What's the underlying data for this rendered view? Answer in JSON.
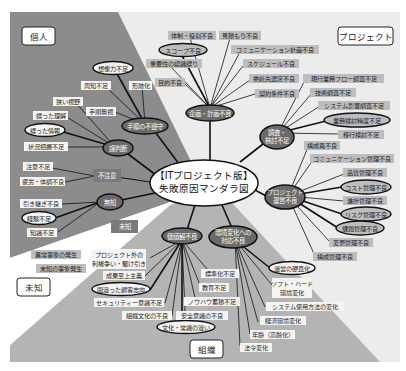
{
  "diagram": {
    "title_line1": "【ITプロジェクト版】",
    "title_line2": "失敗原因マンダラ図",
    "colors": {
      "dark_region": "#8c8c8c",
      "mid_region": "#b4b4b4",
      "light_region": "#ececec",
      "node_fill": "#6a6a6a",
      "label_bg": "#bdbdbd",
      "label_bg_white": "#f4f4f4"
    },
    "quadrants": {
      "individual": "個人",
      "project": "プロジェクト",
      "unknown": "未知",
      "organization": "組織"
    },
    "hubs": {
      "planning": "企画・計画不良",
      "procedure": "手順の不遵守",
      "misjudgment": "誤判断",
      "carelessness": "不注意",
      "ignorance": "無知",
      "unknown_hub": "未知",
      "investigation_l1": "調査・",
      "investigation_l2": "検討不足",
      "pm_l1": "プロジェクト",
      "pm_l2": "運営不良",
      "value": "価値観不良",
      "env_l1": "環境変化への",
      "env_l2": "対応不良"
    },
    "planning_items": [
      "体制・役割不良",
      "見積もり不良",
      "スコープ不良",
      "コミュニケーション計画不良",
      "重要性の認識誤り",
      "スケジュール不良",
      "目的不良",
      "委託先選定不良",
      "契約条件不良"
    ],
    "investigation_items": [
      "現行業務フロー調査不足",
      "技術調査不足",
      "システム影響調査不足",
      "業務検討精度不足",
      "移行検討不足"
    ],
    "pm_items": [
      "構成員不良",
      "コミュニケーション管理不良",
      "品質管理不良",
      "コスト管理不良",
      "進捗管理不良",
      "リスク管理不良",
      "課題管理不良",
      "変更管理不良",
      "構成管理不良"
    ],
    "procedure_items": [
      "想像力不足",
      "周知不足",
      "形骸化",
      "手順無視"
    ],
    "misjudgment_items": [
      "狭い視野",
      "誤った理解",
      "誤った情報",
      "状況把握不足"
    ],
    "carelessness_items": [
      "注意不足",
      "疲労・体調不良"
    ],
    "ignorance_items": [
      "引き継ぎ不良",
      "経験不足",
      "知識不足"
    ],
    "unknown_items": [
      "異常事象の発生",
      "未知の事象発生"
    ],
    "value_items": [
      "プロジェクト外の",
      "利権争い・駆け引き",
      "成果至上主義",
      "間違った顧客志向",
      "セキュリティー意識不足",
      "組織文化の不良",
      "文化・常識の違い",
      "安全意識の不良",
      "ノウハウ蓄積不足",
      "教育不足",
      "標準化不足"
    ],
    "env_items": [
      "運営の硬直化",
      "ソフト・ハード",
      "環境変化",
      "システム使用方法の変化",
      "経済環境変化",
      "年齢（高齢化）",
      "法令変化"
    ]
  }
}
